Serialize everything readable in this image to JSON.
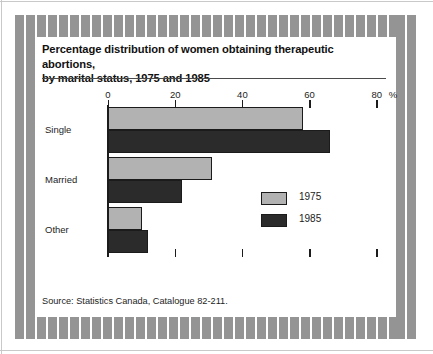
{
  "figure": {
    "title_line1": "Percentage distribution of women obtaining therapeutic abortions,",
    "title_line2": "by marital status, 1975 and 1985",
    "title": "Percentage distribution of women obtaining therapeutic abortions,\nby marital status, 1975 and 1985",
    "source": "Source:   Statistics Canada, Catalogue 82-211."
  },
  "legend": {
    "items": [
      {
        "label": "1975",
        "color": "#b2b2b2"
      },
      {
        "label": "1985",
        "color": "#2b2b2b"
      }
    ]
  },
  "axis": {
    "unit_symbol": "%",
    "tick_labels": [
      "0",
      "20",
      "40",
      "60",
      "80"
    ]
  },
  "categories": [
    "Single",
    "Married",
    "Other"
  ],
  "chart_data": {
    "type": "bar",
    "orientation": "horizontal",
    "title": "Percentage distribution of women obtaining therapeutic abortions, by marital status, 1975 and 1985",
    "subtitle": "",
    "categories": [
      "Single",
      "Married",
      "Other"
    ],
    "series": [
      {
        "name": "1975",
        "color": "#b2b2b2",
        "values": [
          58,
          31,
          10
        ]
      },
      {
        "name": "1985",
        "color": "#2b2b2b",
        "values": [
          66,
          22,
          12
        ]
      }
    ],
    "xlabel": "%",
    "ylabel": "",
    "xlim": [
      0,
      85
    ],
    "xticks": [
      0,
      20,
      40,
      60,
      80
    ],
    "xtick_labels": [
      "0",
      "20",
      "40",
      "60",
      "80"
    ],
    "grid": false,
    "legend_position": "center-right",
    "annotations": [
      "%"
    ],
    "source": "Source:   Statistics Canada, Catalogue 82-211."
  }
}
